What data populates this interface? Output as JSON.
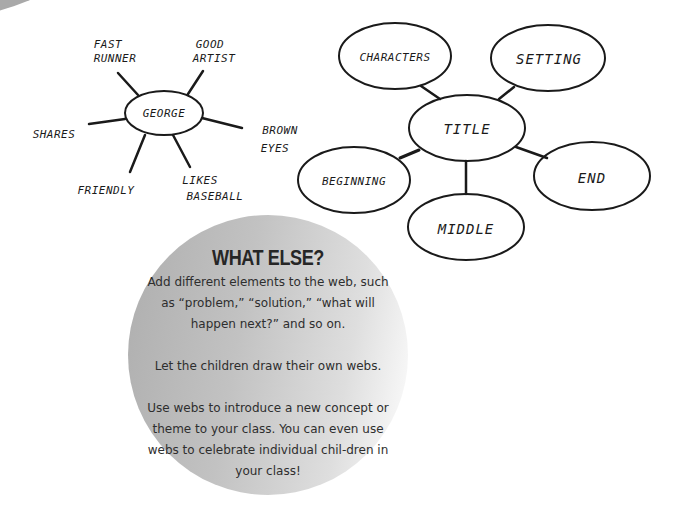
{
  "character_web": {
    "center": "GEORGE",
    "traits": [
      {
        "label_lines": [
          "FAST",
          "RUNNER"
        ]
      },
      {
        "label_lines": [
          "GOOD",
          "ARTIST"
        ]
      },
      {
        "label_lines": [
          "SHARES"
        ]
      },
      {
        "label_lines": [
          "BROWN",
          "EYES"
        ]
      },
      {
        "label_lines": [
          "FRIENDLY"
        ]
      },
      {
        "label_lines": [
          "LIKES",
          "BASEBALL"
        ]
      }
    ]
  },
  "story_web": {
    "center": "TITLE",
    "nodes": [
      "CHARACTERS",
      "SETTING",
      "BEGINNING",
      "END",
      "MIDDLE"
    ]
  },
  "callout": {
    "title": "WHAT ELSE?",
    "paragraphs": [
      "Add different elements to the web, such as “problem,” “solution,” “what will happen next?” and so on.",
      "Let the children draw their own webs.",
      "Use webs to introduce a new concept or theme to your class. You can even use webs to celebrate individual chil-dren in your class!"
    ],
    "colors": {
      "circle_left": "#aeaeae",
      "circle_right": "#ffffff",
      "text": "#2a2a2a"
    }
  }
}
